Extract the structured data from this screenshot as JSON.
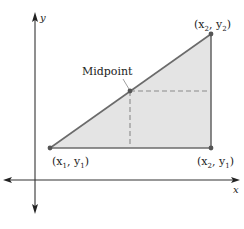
{
  "diagram": {
    "type": "coordinate-geometry",
    "axes": {
      "x_label": "x",
      "y_label": "y",
      "color": "#333333"
    },
    "triangle": {
      "fill": "#e4e4e4",
      "stroke": "#6b6b6b",
      "vertices": [
        {
          "name": "point-x1-y1",
          "label_main": "(x",
          "sub1": "1",
          "mid": ", y",
          "sub2": "1",
          "close": ")"
        },
        {
          "name": "point-x2-y2",
          "label_main": "(x",
          "sub1": "2",
          "mid": ", y",
          "sub2": "2",
          "close": ")"
        },
        {
          "name": "point-x2-y1",
          "label_main": "(x",
          "sub1": "2",
          "mid": ", y",
          "sub2": "1",
          "close": ")"
        }
      ]
    },
    "midpoint": {
      "label": "Midpoint",
      "dashed_color": "#8a8a8a"
    },
    "point_color": "#555555"
  }
}
